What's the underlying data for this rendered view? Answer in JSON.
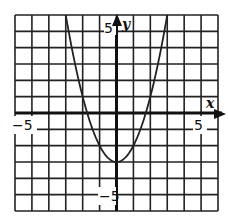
{
  "chart_data": {
    "type": "line",
    "title": "",
    "xlabel": "x",
    "ylabel": "y",
    "xlim": [
      -6,
      6
    ],
    "ylim": [
      -6,
      6
    ],
    "grid": true,
    "grid_step": 1,
    "x_tick_labels": [
      {
        "value": -5,
        "label": "−5"
      },
      {
        "value": 5,
        "label": "5"
      }
    ],
    "y_tick_labels": [
      {
        "value": 5,
        "label": "5"
      },
      {
        "value": -5,
        "label": "−5"
      }
    ],
    "series": [
      {
        "name": "y = x^2 - 3",
        "function": "x^2 - 3",
        "x": [
          -3,
          -2.5,
          -2,
          -1.5,
          -1,
          -0.5,
          0,
          0.5,
          1,
          1.5,
          2,
          2.5,
          3
        ],
        "y": [
          6,
          3.25,
          1,
          -0.75,
          -2,
          -2.75,
          -3,
          -2.75,
          -2,
          -0.75,
          1,
          3.25,
          6
        ]
      }
    ],
    "vertex": [
      0,
      -3
    ],
    "legend": null
  },
  "labels": {
    "x_axis_name": "x",
    "y_axis_name": "y",
    "x_neg": "−5",
    "x_pos": "5",
    "y_pos": "5",
    "y_neg": "−5"
  }
}
